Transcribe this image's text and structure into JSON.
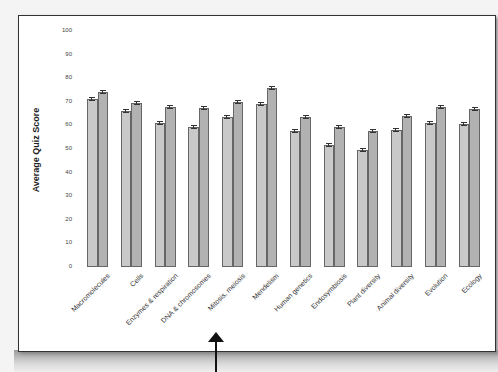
{
  "chart_data": {
    "type": "bar",
    "title": "",
    "xlabel": "",
    "ylabel": "Average Quiz Score",
    "ylim": [
      0,
      100
    ],
    "yticks": [
      0,
      10,
      20,
      30,
      40,
      50,
      60,
      70,
      80,
      90,
      100
    ],
    "grid": false,
    "legend": null,
    "error_bars": true,
    "categories": [
      "Macromolecules",
      "Cells",
      "Enzymes & respiration",
      "DNA & chromosomes",
      "Mitosis, meiosis",
      "Mendelism",
      "Human genetics",
      "Endosymbiosis",
      "Plant diversity",
      "Animal diversity",
      "Evolution",
      "Ecology"
    ],
    "series": [
      {
        "name": "Series 1",
        "color": "#c9c9c9",
        "values": [
          71,
          66,
          61,
          59.5,
          63.5,
          69,
          57.5,
          51.5,
          49.5,
          58,
          61,
          60.5
        ]
      },
      {
        "name": "Series 2",
        "color": "#b2b2b2",
        "values": [
          74,
          69.5,
          68,
          67.5,
          70,
          76,
          63.5,
          59.5,
          57.5,
          64,
          68,
          67
        ]
      }
    ]
  },
  "annotation": {
    "type": "arrow-up",
    "points_to": "Mitosis, meiosis"
  }
}
